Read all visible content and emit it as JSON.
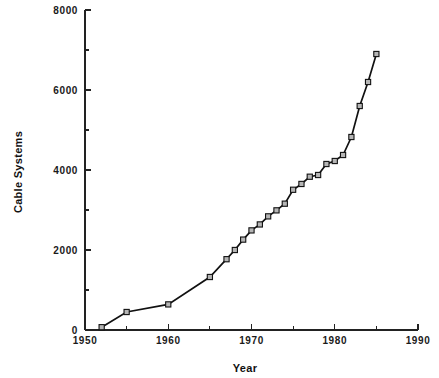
{
  "chart_data": {
    "type": "line",
    "title": "",
    "subtitle": "",
    "xlabel": "Year",
    "ylabel": "Cable Systems",
    "xlim": [
      1950,
      1990
    ],
    "ylim": [
      0,
      8000
    ],
    "grid": false,
    "legend": null,
    "legend_position": "none",
    "x_major_ticks": [
      1950,
      1960,
      1970,
      1980,
      1990
    ],
    "x_minor_ticks": [
      1955,
      1965,
      1975,
      1985
    ],
    "x_tick_labels": [
      "1950",
      "1960",
      "1970",
      "1980",
      "1990"
    ],
    "y_major_ticks": [
      0,
      2000,
      4000,
      6000,
      8000
    ],
    "y_minor_ticks": [
      1000,
      3000,
      5000,
      7000
    ],
    "y_tick_labels": [
      "0",
      "2000",
      "4000",
      "6000",
      "8000"
    ],
    "marker": "open-square",
    "marker_color": "#b5b5b5",
    "line_color": "#111111",
    "series": [
      {
        "name": "Cable Systems",
        "x": [
          1952,
          1955,
          1960,
          1965,
          1967,
          1968,
          1969,
          1970,
          1971,
          1972,
          1973,
          1974,
          1975,
          1976,
          1977,
          1978,
          1979,
          1980,
          1981,
          1982,
          1983,
          1984,
          1985
        ],
        "values": [
          70,
          450,
          640,
          1325,
          1770,
          2000,
          2260,
          2490,
          2639,
          2841,
          2991,
          3158,
          3506,
          3651,
          3832,
          3875,
          4150,
          4225,
          4375,
          4825,
          5600,
          6200,
          6900
        ]
      }
    ]
  },
  "figure": {
    "background_color": "#ffffff",
    "axis_color": "#222222",
    "text_color": "#1a1a1a"
  }
}
